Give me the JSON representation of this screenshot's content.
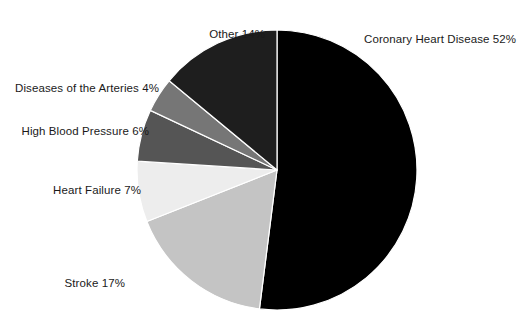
{
  "chart_data": {
    "type": "pie",
    "title": "",
    "subtitle": "",
    "xlabel": "",
    "ylabel": "",
    "legend_position": "none",
    "grid": false,
    "units": "percent",
    "total": 100,
    "start_angle_deg": 0,
    "direction": "clockwise",
    "categories": [
      "Coronary Heart Disease",
      "Stroke",
      "Heart Failure",
      "High Blood Pressure",
      "Diseases of the Arteries",
      "Other"
    ],
    "values": [
      52,
      17,
      7,
      6,
      4,
      14
    ],
    "slices": [
      {
        "label": "Coronary Heart Disease",
        "value": 52,
        "display": "Coronary Heart Disease 52%",
        "color": "#000000",
        "start_deg": 0,
        "end_deg": 187.2,
        "label_side": "right"
      },
      {
        "label": "Stroke",
        "value": 17,
        "display": "Stroke 17%",
        "color": "#c4c4c4",
        "start_deg": 187.2,
        "end_deg": 248.4,
        "label_side": "left"
      },
      {
        "label": "Heart Failure",
        "value": 7,
        "display": "Heart Failure 7%",
        "color": "#ededed",
        "start_deg": 248.4,
        "end_deg": 273.6,
        "label_side": "left"
      },
      {
        "label": "High Blood Pressure",
        "value": 6,
        "display": "High Blood Pressure 6%",
        "color": "#555555",
        "start_deg": 273.6,
        "end_deg": 295.2,
        "label_side": "left"
      },
      {
        "label": "Diseases of the Arteries",
        "value": 4,
        "display": "Diseases of the Arteries 4%",
        "color": "#767676",
        "start_deg": 295.2,
        "end_deg": 309.6,
        "label_side": "left"
      },
      {
        "label": "Other",
        "value": 14,
        "display": "Other 14%",
        "color": "#1e1e1e",
        "start_deg": 309.6,
        "end_deg": 360,
        "label_side": "left"
      }
    ],
    "geometry": {
      "center_x": 277,
      "center_y": 170,
      "radius": 140,
      "separator_color": "#ffffff",
      "separator_width": 1.2,
      "background": "#ffffff"
    }
  }
}
